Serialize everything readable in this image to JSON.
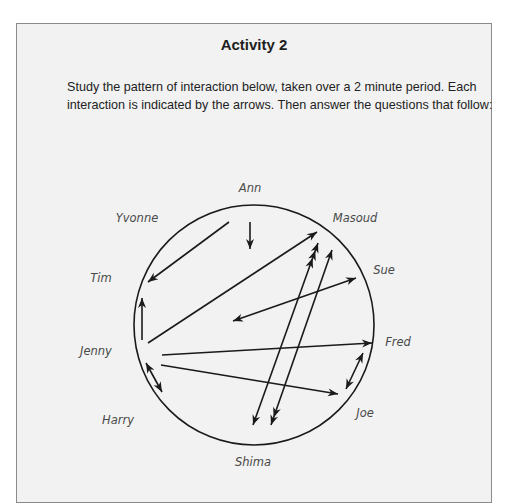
{
  "activity": {
    "title": "Activity 2",
    "instructions": "Study the pattern of interaction below, taken over a 2 minute period. Each interaction is indicated by the arrows. Then answer the questions that follow:"
  },
  "diagram": {
    "participants": [
      {
        "name": "Ann",
        "x": 250,
        "y": 192
      },
      {
        "name": "Yvonne",
        "x": 137,
        "y": 222
      },
      {
        "name": "Masoud",
        "x": 355,
        "y": 222
      },
      {
        "name": "Tim",
        "x": 101,
        "y": 282
      },
      {
        "name": "Sue",
        "x": 384,
        "y": 274
      },
      {
        "name": "Jenny",
        "x": 96,
        "y": 355
      },
      {
        "name": "Fred",
        "x": 398,
        "y": 346
      },
      {
        "name": "Harry",
        "x": 118,
        "y": 424
      },
      {
        "name": "Joe",
        "x": 365,
        "y": 417
      },
      {
        "name": "Shima",
        "x": 253,
        "y": 466
      }
    ],
    "interactions": [
      {
        "from": "Ann",
        "to": "centre",
        "x1": 250,
        "y1": 222,
        "x2": 250,
        "y2": 249,
        "start_heads": 0,
        "end_heads": 1
      },
      {
        "from": "Yvonne",
        "to": "Tim",
        "x1": 229,
        "y1": 222,
        "x2": 148,
        "y2": 282,
        "start_heads": 0,
        "end_heads": 1
      },
      {
        "from": "Jenny",
        "to": "Tim",
        "x1": 142,
        "y1": 340,
        "x2": 142,
        "y2": 298,
        "start_heads": 0,
        "end_heads": 1
      },
      {
        "from": "Jenny",
        "to": "Masoud",
        "x1": 148,
        "y1": 343,
        "x2": 317,
        "y2": 232,
        "start_heads": 0,
        "end_heads": 1
      },
      {
        "from": "Sue",
        "to": "centre",
        "x1": 356,
        "y1": 278,
        "x2": 233,
        "y2": 321,
        "start_heads": 1,
        "end_heads": 1
      },
      {
        "from": "Shima",
        "to": "Masoud",
        "x1": 253,
        "y1": 425,
        "x2": 318,
        "y2": 243,
        "start_heads": 1,
        "end_heads": 3
      },
      {
        "from": "Masoud",
        "to": "Shima",
        "x1": 332,
        "y1": 250,
        "x2": 271,
        "y2": 425,
        "start_heads": 1,
        "end_heads": 2
      },
      {
        "from": "Jenny",
        "to": "Fred",
        "x1": 162,
        "y1": 355,
        "x2": 372,
        "y2": 343,
        "start_heads": 0,
        "end_heads": 1
      },
      {
        "from": "Jenny",
        "to": "Joe",
        "x1": 161,
        "y1": 365,
        "x2": 338,
        "y2": 394,
        "start_heads": 0,
        "end_heads": 1
      },
      {
        "from": "Fred",
        "to": "Joe",
        "x1": 363,
        "y1": 353,
        "x2": 346,
        "y2": 389,
        "start_heads": 1,
        "end_heads": 1
      },
      {
        "from": "Jenny",
        "to": "Harry",
        "x1": 146,
        "y1": 363,
        "x2": 162,
        "y2": 392,
        "start_heads": 1,
        "end_heads": 1
      }
    ],
    "circle": {
      "cx": 254,
      "cy": 325,
      "r": 120
    }
  }
}
